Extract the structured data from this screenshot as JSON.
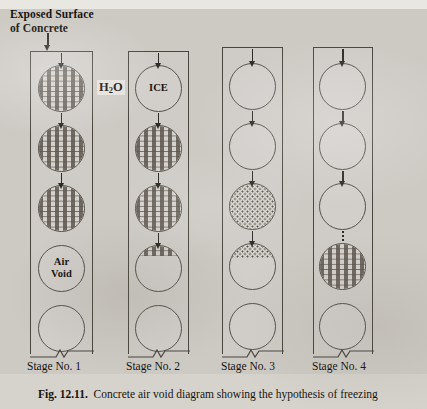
{
  "figure": {
    "header_label": "Exposed Surface\nof Concrete",
    "header_line1": "Exposed Surface",
    "header_line2": "of Concrete",
    "water_label": "H2O",
    "water_label_prefix": "H",
    "water_label_sub": "2",
    "water_label_suffix": "O",
    "ice_label": "ICE",
    "air_void_line1": "Air",
    "air_void_line2": "Void",
    "caption_bold": "Fig. 12.11.",
    "caption_text": "Concrete air void diagram showing the hypothesis of freezing",
    "ink_color": "#2e2a25",
    "paper_color": "#cdcac4",
    "line_color": "#4a463f"
  },
  "columns": [
    {
      "id": "stage-1",
      "label": "Stage No. 1",
      "voids": [
        {
          "index": 1,
          "fill": "hatch",
          "fill_percent": 100,
          "label": ""
        },
        {
          "index": 2,
          "fill": "hatch",
          "fill_percent": 100,
          "label": ""
        },
        {
          "index": 3,
          "fill": "hatch",
          "fill_percent": 100,
          "label": ""
        },
        {
          "index": 4,
          "fill": "none",
          "fill_percent": 0,
          "label": "Air Void"
        },
        {
          "index": 5,
          "fill": "none",
          "fill_percent": 0,
          "label": ""
        }
      ],
      "arrows": [
        {
          "from": "top",
          "style": "solid"
        },
        {
          "from": "void-1",
          "style": "solid"
        },
        {
          "from": "void-2",
          "style": "solid"
        }
      ]
    },
    {
      "id": "stage-2",
      "label": "Stage No. 2",
      "voids": [
        {
          "index": 1,
          "fill": "none",
          "fill_percent": 0,
          "label": "ICE"
        },
        {
          "index": 2,
          "fill": "hatch",
          "fill_percent": 100,
          "label": ""
        },
        {
          "index": 3,
          "fill": "hatch",
          "fill_percent": 100,
          "label": ""
        },
        {
          "index": 4,
          "fill": "hatch",
          "fill_percent": 22,
          "label": ""
        },
        {
          "index": 5,
          "fill": "none",
          "fill_percent": 0,
          "label": ""
        }
      ],
      "arrows": [
        {
          "from": "top",
          "style": "solid"
        },
        {
          "from": "void-1",
          "style": "solid"
        },
        {
          "from": "void-2",
          "style": "solid"
        },
        {
          "from": "void-3",
          "style": "solid"
        }
      ]
    },
    {
      "id": "stage-3",
      "label": "Stage No. 3",
      "voids": [
        {
          "index": 1,
          "fill": "none",
          "fill_percent": 0,
          "label": ""
        },
        {
          "index": 2,
          "fill": "none",
          "fill_percent": 0,
          "label": ""
        },
        {
          "index": 3,
          "fill": "dots",
          "fill_percent": 100,
          "label": ""
        },
        {
          "index": 4,
          "fill": "dots",
          "fill_percent": 30,
          "label": ""
        },
        {
          "index": 5,
          "fill": "none",
          "fill_percent": 0,
          "label": ""
        }
      ],
      "arrows": [
        {
          "from": "top",
          "style": "solid"
        },
        {
          "from": "void-1",
          "style": "solid"
        },
        {
          "from": "void-2",
          "style": "solid"
        },
        {
          "from": "void-3",
          "style": "solid"
        }
      ]
    },
    {
      "id": "stage-4",
      "label": "Stage No. 4",
      "voids": [
        {
          "index": 1,
          "fill": "none",
          "fill_percent": 0,
          "label": ""
        },
        {
          "index": 2,
          "fill": "none",
          "fill_percent": 0,
          "label": ""
        },
        {
          "index": 3,
          "fill": "none",
          "fill_percent": 0,
          "label": ""
        },
        {
          "index": 4,
          "fill": "hatch",
          "fill_percent": 100,
          "label": ""
        },
        {
          "index": 5,
          "fill": "none",
          "fill_percent": 0,
          "label": ""
        }
      ],
      "arrows": [
        {
          "from": "top",
          "style": "solid"
        },
        {
          "from": "void-1",
          "style": "solid"
        },
        {
          "from": "void-2",
          "style": "solid"
        },
        {
          "from": "void-3",
          "style": "dashed"
        }
      ]
    }
  ]
}
